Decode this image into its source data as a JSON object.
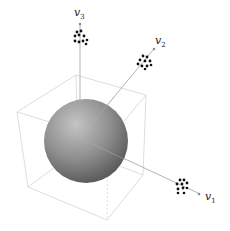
{
  "diagram": {
    "axes": [
      {
        "id": "v1",
        "label": "v",
        "subscript": "1"
      },
      {
        "id": "v2",
        "label": "v",
        "subscript": "2"
      },
      {
        "id": "v3",
        "label": "v",
        "subscript": "3"
      }
    ],
    "colors": {
      "sphere_light": "#bdbdbd",
      "sphere_dark": "#5a5a5a",
      "cube_edge": "#c8c8c8",
      "axis": "#9a9a9a",
      "points": "#111111"
    }
  }
}
